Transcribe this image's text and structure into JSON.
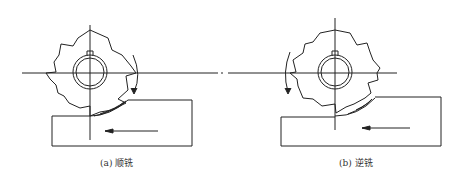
{
  "figure": {
    "panels": [
      {
        "id": "a",
        "caption": "(a) 顺铣",
        "cutter_rotation": "clockwise",
        "feed_direction": "left"
      },
      {
        "id": "b",
        "caption": "(b) 逆铣",
        "cutter_rotation": "counterclockwise",
        "feed_direction": "left"
      }
    ]
  },
  "colors": {
    "line": "#222222",
    "background": "#ffffff"
  }
}
